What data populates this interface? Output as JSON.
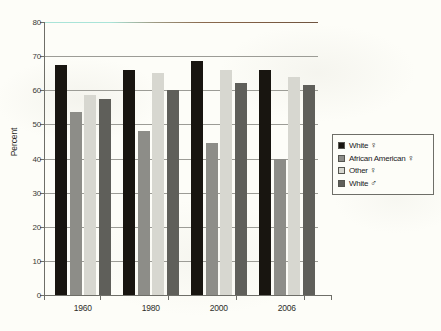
{
  "figure": {
    "background_color": "#fdfdf8",
    "caption_ghost": "a partial line of text clipped at the bottom edge"
  },
  "chart_data": {
    "type": "bar",
    "title": "",
    "subtitle": "",
    "xlabel": "",
    "ylabel": "Percent",
    "categories": [
      "1960",
      "1980",
      "2000",
      "2006"
    ],
    "series": [
      {
        "name": "White ♀",
        "color": "#181510",
        "values": [
          67.5,
          66.0,
          68.5,
          66.0
        ]
      },
      {
        "name": "African American ♀",
        "color": "#8d8d88",
        "values": [
          53.5,
          48.0,
          44.5,
          40.0
        ]
      },
      {
        "name": "Other ♀",
        "color": "#d7d7d0",
        "values": [
          58.5,
          65.0,
          66.0,
          64.0
        ]
      },
      {
        "name": "White ♂",
        "color": "#5f5f5a",
        "values": [
          57.5,
          60.0,
          62.0,
          61.5
        ]
      }
    ],
    "ylim": [
      0,
      80
    ],
    "ytick_values": [
      0,
      10,
      20,
      30,
      40,
      50,
      60,
      70,
      80
    ],
    "ytick_labels": [
      "0",
      "10",
      "20",
      "30",
      "40",
      "50",
      "60",
      "70",
      "80"
    ],
    "grid": true,
    "grid_orientation": "horizontal",
    "legend_position": "right",
    "top_gridline_artifact_colors": [
      "#a9e4d8",
      "#8a6a4e"
    ]
  },
  "legend": {
    "entries": [
      {
        "label": "White",
        "symbol": "♀",
        "symbol_name": "female-symbol",
        "color": "#181510"
      },
      {
        "label": "African American",
        "symbol": "♀",
        "symbol_name": "female-symbol",
        "color": "#8d8d88"
      },
      {
        "label": "Other",
        "symbol": "♀",
        "symbol_name": "female-symbol",
        "color": "#d7d7d0"
      },
      {
        "label": "White",
        "symbol": "♂",
        "symbol_name": "male-symbol",
        "color": "#5f5f5a"
      }
    ]
  }
}
